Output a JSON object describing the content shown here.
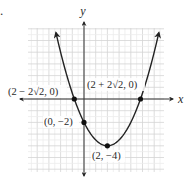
{
  "problem_number_fragment": ".",
  "chart_data": {
    "type": "line",
    "title": "",
    "function": "y = 0.5x^2 - 2x - 2",
    "xlabel": "x",
    "ylabel": "y",
    "xlim": [
      -4.7,
      6.8
    ],
    "ylim": [
      -6.3,
      6.0
    ],
    "grid": true,
    "grid_minor_step": 0.5,
    "grid_major_step": 1,
    "tick_labels_shown": false,
    "curve": {
      "shape": "upward parabola",
      "vertex": [
        2,
        -4
      ],
      "arrows_at_ends": true,
      "x_range_drawn": [
        -2.4,
        6.4
      ]
    },
    "points": [
      {
        "label": "(2 − 2√2, 0)",
        "x": -0.828,
        "y": 0
      },
      {
        "label": "(2 + 2√2, 0)",
        "x": 4.828,
        "y": 0
      },
      {
        "label": "(0, −2)",
        "x": 0,
        "y": -2
      },
      {
        "label": "(2, −4)",
        "x": 2,
        "y": -4
      }
    ],
    "colors": {
      "curve": "#222222",
      "axes": "#333333",
      "grid_major": "#d4d4d4",
      "grid_minor": "#ececec",
      "points": "#111111"
    }
  },
  "labels": {
    "x_axis": "x",
    "y_axis": "y",
    "left_intercept": "(2 − 2√2, 0)",
    "right_intercept": "(2 + 2√2, 0)",
    "y_intercept": "(0, −2)",
    "vertex": "(2, −4)"
  }
}
